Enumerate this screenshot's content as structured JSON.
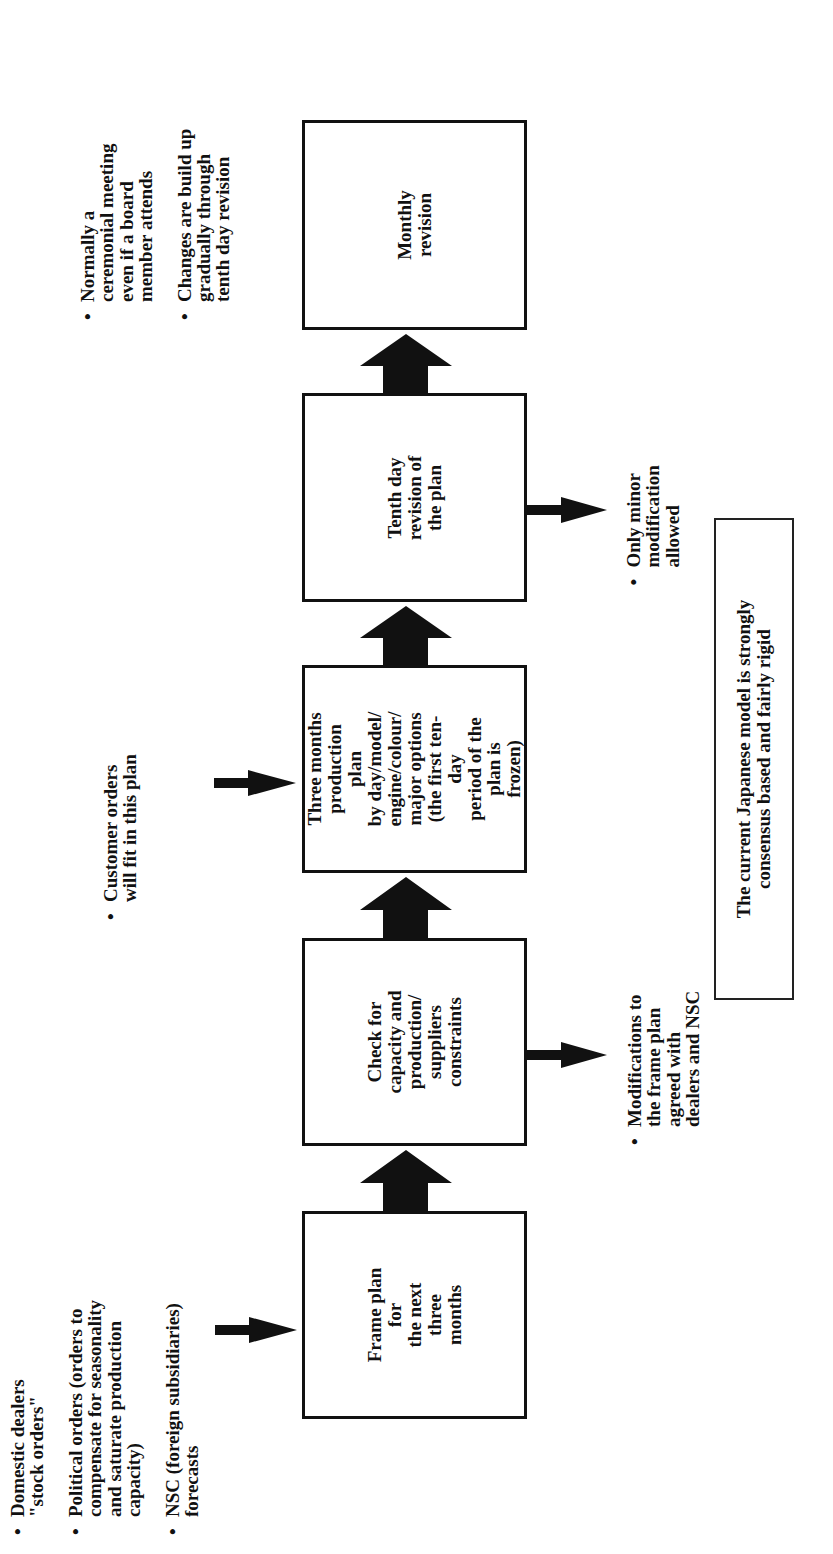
{
  "diagram": {
    "orientation": "rotated-90-ccw",
    "flow_direction": "bottom-to-top",
    "colors": {
      "ink": "#111111",
      "background": "#ffffff"
    },
    "steps": [
      {
        "id": "frame-plan",
        "label": "Frame plan for\nthe next three\nmonths"
      },
      {
        "id": "check-constraints",
        "label": "Check for\ncapacity and\nproduction/\nsuppliers\nconstraints"
      },
      {
        "id": "three-month-plan",
        "label": "Three months\nproduction plan\nby day/model/\nengine/colour/\nmajor options\n(the first ten-day\nperiod of the\nplan is frozen)"
      },
      {
        "id": "tenth-day-revision",
        "label": "Tenth day\nrevision of\nthe plan"
      },
      {
        "id": "monthly-revision",
        "label": "Monthly\nrevision"
      }
    ],
    "inputs": {
      "frame_plan": [
        "Domestic dealers\n\"stock orders\"",
        "Political orders (orders to\ncompensate for seasonality\nand saturate production\ncapacity)",
        "NSC (foreign subsidiaries)\nforecasts"
      ],
      "three_month_plan": [
        "Customer orders\nwill fit in this plan"
      ],
      "monthly_revision": [
        "Normally a\nceremonial meeting\neven if a board\nmember attends",
        "Changes are build up\ngradually through\ntenth day revision"
      ]
    },
    "outputs": {
      "check_constraints": [
        "Modifications to\nthe frame plan\nagreed with\ndealers and NSC"
      ],
      "tenth_day_revision": [
        "Only minor\nmodification\nallowed"
      ]
    },
    "summary": "The current Japanese model is strongly\nconsensus based and fairly rigid"
  }
}
